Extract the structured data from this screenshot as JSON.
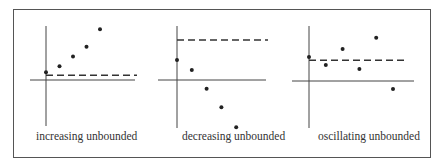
{
  "chart_data": {
    "type": "scatter",
    "panels": [
      {
        "caption": "increasing unbounded",
        "reference_line": 1.2,
        "points": [
          [
            0,
            2
          ],
          [
            1,
            3.5
          ],
          [
            2,
            6
          ],
          [
            3,
            8.5
          ],
          [
            4,
            13
          ]
        ]
      },
      {
        "caption": "decreasing unbounded",
        "reference_line": 10,
        "points": [
          [
            0,
            5
          ],
          [
            1,
            2.5
          ],
          [
            2,
            -2.2
          ],
          [
            3,
            -6.8
          ],
          [
            4,
            -11.8
          ]
        ]
      },
      {
        "caption": "oscillating unbounded",
        "reference_line": 5.2,
        "points": [
          [
            0,
            6
          ],
          [
            1,
            4
          ],
          [
            2,
            8
          ],
          [
            3,
            3
          ],
          [
            4,
            10.8
          ],
          [
            5,
            -2
          ]
        ]
      }
    ]
  }
}
